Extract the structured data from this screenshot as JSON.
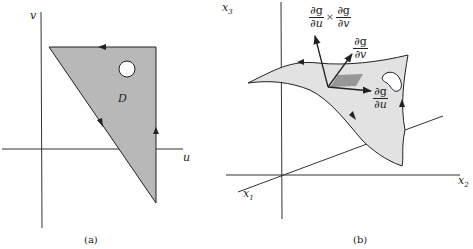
{
  "panel_a": {
    "caption": "(a)",
    "axis_labels": {
      "horizontal": "u",
      "vertical": "v"
    },
    "region_label": "D",
    "region_color": "#b8b8b8",
    "triangle_vertices": [
      [
        49,
        47
      ],
      [
        156,
        47
      ],
      [
        156,
        203
      ]
    ],
    "hole": {
      "cx": 127,
      "cy": 69,
      "r": 8
    },
    "orientation_arrows": [
      "top-edge-left",
      "diagonal-down",
      "right-edge-up"
    ]
  },
  "panel_b": {
    "caption": "(b)",
    "axis_labels": {
      "x1": "x",
      "x1_sub": "1",
      "x2": "x",
      "x2_sub": "2",
      "x3": "x",
      "x3_sub": "3"
    },
    "surface_color": "#e2e2e2",
    "patch_color": "#8a8a8a",
    "vectors": {
      "normal": {
        "num_left": "∂g",
        "den_left": "∂u",
        "times": "×",
        "num_right": "∂g",
        "den_right": "∂v"
      },
      "dg_dv": {
        "num": "∂g",
        "den": "∂v"
      },
      "dg_du": {
        "num": "∂g",
        "den": "∂u"
      }
    }
  }
}
